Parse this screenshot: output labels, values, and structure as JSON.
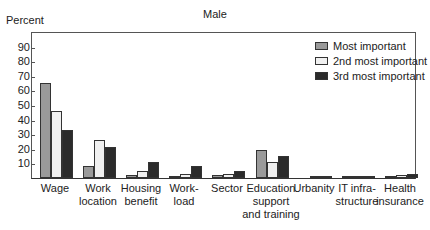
{
  "chart_data": {
    "type": "bar",
    "title": "Male",
    "xlabel": "",
    "ylabel": "Percent",
    "ylim": [
      0,
      100
    ],
    "yticks": [
      10,
      20,
      30,
      40,
      50,
      60,
      70,
      80,
      90
    ],
    "grid": false,
    "legend_position": "upper right",
    "categories": [
      "Wage",
      "Work location",
      "Housing benefit",
      "Work-load",
      "Sector",
      "Education support and training",
      "Urbanity",
      "IT infra-structure",
      "Health insurance"
    ],
    "category_labels": [
      [
        "Wage"
      ],
      [
        "Work",
        "location"
      ],
      [
        "Housing",
        "benefit"
      ],
      [
        "Work-",
        "load"
      ],
      [
        "Sector"
      ],
      [
        "Education",
        "support",
        "and training"
      ],
      [
        "Urbanity"
      ],
      [
        "IT infra-",
        "structure"
      ],
      [
        "Health",
        "insurance"
      ]
    ],
    "series": [
      {
        "name": "Most important",
        "color": "#9a9a9a",
        "values": [
          65,
          8,
          2,
          1,
          2,
          19,
          0,
          0.5,
          1
        ]
      },
      {
        "name": "2nd most important",
        "color": "#f0f0f0",
        "values": [
          46,
          26,
          5,
          3,
          3,
          11,
          0.5,
          0.5,
          2
        ]
      },
      {
        "name": "3rd most important",
        "color": "#2b2b2b",
        "values": [
          33,
          21,
          11,
          8,
          5,
          15,
          1,
          1,
          3
        ]
      }
    ]
  }
}
